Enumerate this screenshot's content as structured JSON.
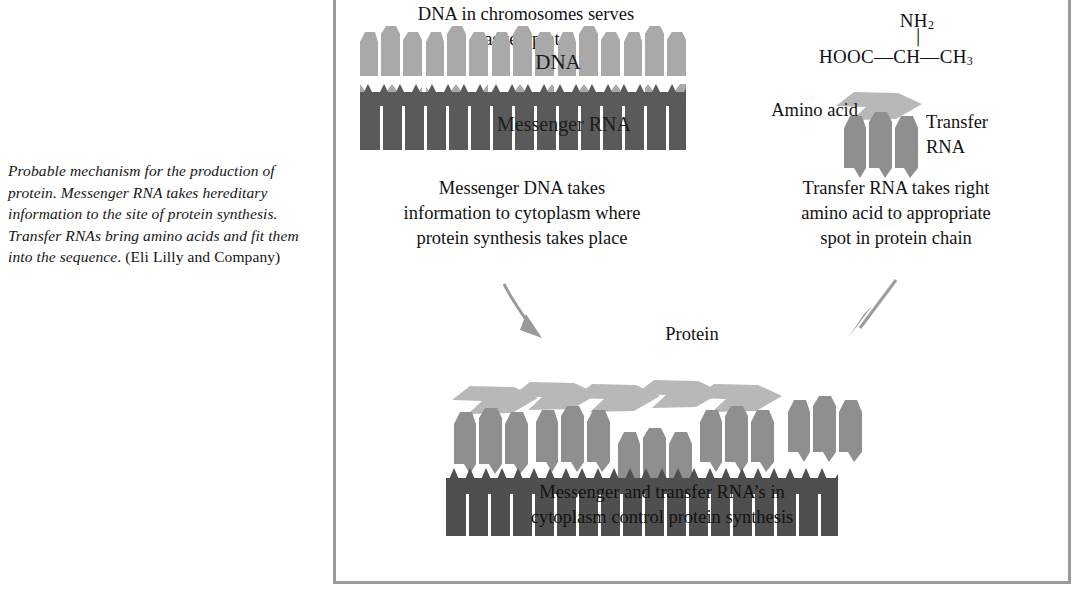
{
  "figure": {
    "caption": {
      "italic_part": "Probable mechanism for the production of protein. Messenger RNA takes hereditary information to the site of protein synthesis. Transfer RNAs bring amino acids and fit them into the ",
      "italic_tail": "sequence",
      "roman_part": ". (Eli Lilly and Company)",
      "full_text": "Probable mechanism for the production of protein. Messenger RNA takes hereditary information to the site of protein synthesis. Transfer RNAs bring amino acids and fit them into the sequence. (Eli Lilly and Company)"
    },
    "labels": {
      "top_left": "DNA in chromosomes serves\nas template",
      "dna_strand": "DNA",
      "mrna_strand": "Messenger RNA",
      "left_caption": "Messenger DNA takes\ninformation to cytoplasm where\nprotein synthesis takes place",
      "amino_acid": "Amino acid",
      "transfer_rna": "Transfer\nRNA",
      "right_caption": "Transfer RNA takes right\namino acid to appropriate\nspot in protein chain",
      "protein": "Protein",
      "bottom_caption": "Messenger and transfer RNA’s in\ncytoplasm control protein synthesis"
    },
    "chemical_formula": {
      "amine_group": "NH",
      "amine_subscript": "2",
      "bond": "│",
      "acid_group": "HOOC",
      "dash1": "—",
      "alpha_carbon": "CH",
      "dash2": "—",
      "methyl_group": "CH",
      "methyl_subscript": "3",
      "compound": "HOOC—CH(NH2)—CH3"
    },
    "colors": {
      "dna_light_gray": "#a9a9a9",
      "mrna_dark_gray": "#5a5a5a",
      "trna_mid_gray": "#8f8f8f",
      "amino_acid_gray": "#b8b8b8",
      "frame_border": "#9b9b9b",
      "arrow_gray": "#9a9a9a",
      "text_black": "#121212",
      "background": "#ffffff"
    },
    "structure": {
      "dna_units": 6,
      "dna_blocks_per_unit": 3,
      "mrna_teeth_top": 18,
      "protein_trna_units": 5,
      "protein_amino_acids": 5,
      "protein_mrna_teeth": 16,
      "arrows": 2
    }
  }
}
